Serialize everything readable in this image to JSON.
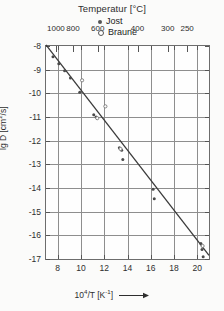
{
  "chart_data": {
    "type": "scatter",
    "title": "Temperatur [°C]",
    "xlabel": "10⁴/T [K⁻¹]",
    "ylabel": "lg D [cm²/s]",
    "xlim": [
      7,
      21
    ],
    "ylim": [
      -17,
      -8
    ],
    "xticks": [
      8,
      10,
      12,
      14,
      16,
      18,
      20
    ],
    "yticks": [
      -8,
      -9,
      -10,
      -11,
      -12,
      -13,
      -14,
      -15,
      -16,
      -17
    ],
    "grid": true,
    "legend_position": "top-right",
    "secondary_axis": {
      "label": "Temperatur [°C]",
      "position": "top",
      "ticks": [
        1000,
        800,
        600,
        400,
        300,
        250
      ],
      "tick_x_positions": [
        7.85,
        9.32,
        11.45,
        14.86,
        17.45,
        19.12
      ]
    },
    "fit_line": {
      "label": "Arrhenius fit",
      "x": [
        7.0,
        21.0
      ],
      "y": [
        -7.95,
        -16.85
      ]
    },
    "series": [
      {
        "name": "Jost",
        "marker": "filled-circle",
        "color": "#4a4a4a",
        "points": [
          {
            "x": 7.6,
            "y": -8.45
          },
          {
            "x": 8.1,
            "y": -8.75
          },
          {
            "x": 8.6,
            "y": -9.05
          },
          {
            "x": 9.1,
            "y": -9.35
          },
          {
            "x": 9.9,
            "y": -9.95
          },
          {
            "x": 11.1,
            "y": -10.9
          },
          {
            "x": 11.3,
            "y": -11.0
          },
          {
            "x": 13.3,
            "y": -12.3
          },
          {
            "x": 13.5,
            "y": -12.4
          },
          {
            "x": 13.6,
            "y": -12.8
          },
          {
            "x": 16.2,
            "y": -14.05
          },
          {
            "x": 16.3,
            "y": -14.45
          },
          {
            "x": 20.3,
            "y": -16.35
          },
          {
            "x": 20.4,
            "y": -16.6
          },
          {
            "x": 20.5,
            "y": -16.9
          }
        ]
      },
      {
        "name": "Braune",
        "marker": "open-circle",
        "color": "#777777",
        "points": [
          {
            "x": 10.1,
            "y": -9.45
          },
          {
            "x": 12.1,
            "y": -10.55
          },
          {
            "x": 11.4,
            "y": -11.05
          },
          {
            "x": 13.4,
            "y": -12.35
          },
          {
            "x": 20.45,
            "y": -16.45
          }
        ]
      }
    ]
  },
  "legend": {
    "items": [
      {
        "label": "Jost"
      },
      {
        "label": "Braune"
      }
    ]
  }
}
